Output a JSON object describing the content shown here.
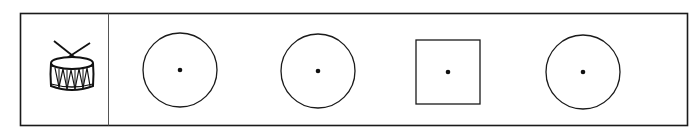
{
  "figure": {
    "frame": {
      "x": 20,
      "y": 13,
      "width": 667,
      "height": 112,
      "divider_x": 108
    },
    "stroke_color": "#1a1a1a",
    "label_cell": {
      "icon": "drum-icon"
    },
    "shapes": [
      {
        "type": "circle",
        "cx": 180,
        "cy": 70,
        "r": 37,
        "has_center_dot": true
      },
      {
        "type": "circle",
        "cx": 318,
        "cy": 71,
        "r": 37,
        "has_center_dot": true
      },
      {
        "type": "square",
        "x": 416,
        "y": 40,
        "size": 64,
        "has_center_dot": true
      },
      {
        "type": "circle",
        "cx": 583,
        "cy": 72,
        "r": 37,
        "has_center_dot": true
      }
    ]
  }
}
